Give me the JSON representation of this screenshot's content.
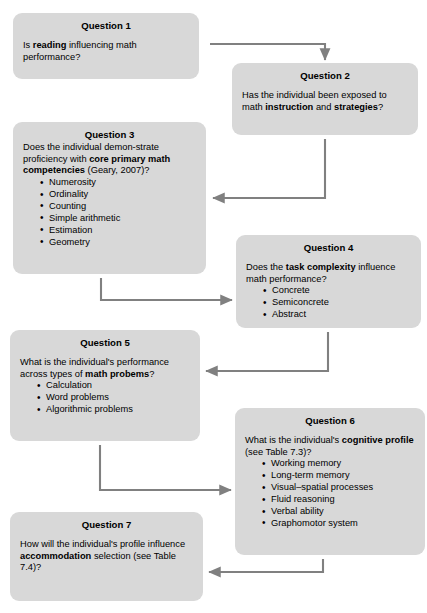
{
  "diagram": {
    "box_fill": "#d8d8d8",
    "connector_color": "#808080",
    "boxes": [
      {
        "id": "q1",
        "title": "Question 1",
        "body_html": "Is <b>reading</b> influencing math performance?",
        "bullets": []
      },
      {
        "id": "q2",
        "title": "Question 2",
        "body_html": "Has the individual been exposed to math <b>instruction</b> and <b>strategies</b>?",
        "bullets": []
      },
      {
        "id": "q3",
        "title": "Question 3",
        "body_html": "Does the individual demon-strate proficiency with <b>core primary math competencies</b> (Geary, 2007)?",
        "bullets": [
          "Numerosity",
          "Ordinality",
          "Counting",
          "Simple arithmetic",
          "Estimation",
          "Geometry"
        ]
      },
      {
        "id": "q4",
        "title": "Question 4",
        "body_html": "Does the <b>task complexity</b> influence math performance?",
        "bullets": [
          "Concrete",
          "Semiconcrete",
          "Abstract"
        ]
      },
      {
        "id": "q5",
        "title": "Question 5",
        "body_html": "What is the individual's performance across types of <b>math probems</b>?",
        "bullets": [
          "Calculation",
          "Word problems",
          "Algorithmic problems"
        ]
      },
      {
        "id": "q6",
        "title": "Question 6",
        "body_html": "What is the individual's <b>cognitive profile</b> (see Table 7.3)?",
        "bullets": [
          "Working memory",
          "Long-term memory",
          "Visual–spatial processes",
          "Fluid reasoning",
          "Verbal ability",
          "Graphomotor system"
        ]
      },
      {
        "id": "q7",
        "title": "Question 7",
        "body_html": "How will the individual's profile influence <b>accommodation</b> selection (see Table 7.4)?",
        "bullets": []
      }
    ],
    "connectors": [
      {
        "id": "c1",
        "from": "q1",
        "to": "q2",
        "route": "right-then-down"
      },
      {
        "id": "c2",
        "from": "q2",
        "to": "q3",
        "route": "down-then-left"
      },
      {
        "id": "c3",
        "from": "q3",
        "to": "q4",
        "route": "down-then-right"
      },
      {
        "id": "c4",
        "from": "q4",
        "to": "q5",
        "route": "down-then-left"
      },
      {
        "id": "c5",
        "from": "q5",
        "to": "q6",
        "route": "down-then-right"
      },
      {
        "id": "c6",
        "from": "q6",
        "to": "q7",
        "route": "down-then-left"
      }
    ]
  }
}
